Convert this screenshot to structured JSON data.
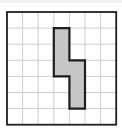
{
  "diagram": {
    "type": "grid-with-shaded-polygon",
    "grid": {
      "columns": 7,
      "rows": 7,
      "origin_px": [
        7,
        12
      ],
      "cell_width_px": 15.6,
      "cell_height_px": 16.1,
      "line_color": "#cfcfcf",
      "border_color": "#1e1e1e"
    },
    "shape": {
      "description": "Z-like shaded polygon made of 6 unit squares",
      "fill_color": "#c6c6c6",
      "stroke_color": "#1e1e1e",
      "cells": [
        [
          3,
          1
        ],
        [
          3,
          2
        ],
        [
          3,
          3
        ],
        [
          4,
          3
        ],
        [
          4,
          4
        ],
        [
          4,
          5
        ]
      ],
      "vertices_grid_units": [
        [
          3,
          1
        ],
        [
          4,
          1
        ],
        [
          4,
          3
        ],
        [
          5,
          3
        ],
        [
          5,
          6
        ],
        [
          4,
          6
        ],
        [
          4,
          4
        ],
        [
          3,
          4
        ]
      ]
    }
  }
}
